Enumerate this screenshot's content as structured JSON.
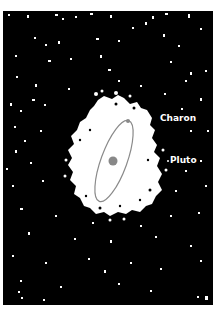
{
  "figure": {
    "background_color": "#000000",
    "page_color": "#ffffff",
    "halo_color": "#ffffff",
    "orbit_color": "#8a8a8a",
    "body_color": "#888888"
  },
  "labels": {
    "charon": "Charon",
    "pluto": "Pluto"
  },
  "orbit": {
    "center_x": 114,
    "center_y": 161,
    "radius_x": 13,
    "radius_y": 43,
    "rotation_deg": 20
  },
  "pluto_marker": {
    "x": 113,
    "y": 161,
    "r": 4.5
  },
  "charon_marker": {
    "x": 128,
    "y": 121,
    "r": 2
  }
}
